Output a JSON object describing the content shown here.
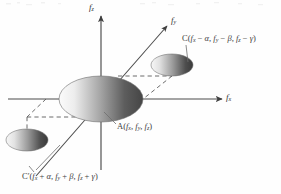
{
  "figure": {
    "kind": "3d-axes-diagram",
    "background_color": "#fefefe",
    "line_color": "#4a4a4a",
    "dash_color": "#5a5a5a",
    "text_color": "#3d3d3d"
  },
  "axes": [
    {
      "id": "fx",
      "label_main": "f",
      "label_sub": "x",
      "direction": "right-horizontal",
      "has_arrow": true
    },
    {
      "id": "fy",
      "label_main": "f",
      "label_sub": "y",
      "direction": "upper-right-diagonal",
      "has_arrow": true
    },
    {
      "id": "fz",
      "label_main": "f",
      "label_sub": "z",
      "direction": "up-vertical",
      "has_arrow": true
    }
  ],
  "points": {
    "A": {
      "name": "A",
      "prefix": "A(",
      "terms": [
        {
          "main": "f",
          "sub": "x"
        },
        {
          "main": "f",
          "sub": "y"
        },
        {
          "main": "f",
          "sub": "z"
        }
      ],
      "separators": [
        ", ",
        ", "
      ],
      "suffix": ")",
      "plain": "A(fx, fy, fz)"
    },
    "C": {
      "name": "C",
      "prefix": "C(",
      "terms": [
        {
          "main": "f",
          "sub": "x",
          "op": " − ",
          "greek": "α"
        },
        {
          "main": "f",
          "sub": "y",
          "op": " − ",
          "greek": "β"
        },
        {
          "main": "f",
          "sub": "z",
          "op": " − ",
          "greek": "γ"
        }
      ],
      "separators": [
        ", ",
        ", "
      ],
      "suffix": ")",
      "plain": "C(fx − α, fy − β, fz − γ)"
    },
    "C_prime": {
      "name": "C′",
      "prefix": "C′(",
      "terms": [
        {
          "main": "f",
          "sub": "x",
          "op": " + ",
          "greek": "α"
        },
        {
          "main": "f",
          "sub": "y",
          "op": " + ",
          "greek": "β"
        },
        {
          "main": "f",
          "sub": "z",
          "op": " + ",
          "greek": "γ"
        }
      ],
      "separators": [
        ", ",
        ", "
      ],
      "suffix": ")",
      "plain": "C′(fx + α, fy + β, fz + γ)"
    }
  },
  "disks": [
    {
      "id": "disk-A",
      "role": "origin-disk",
      "cx": 101,
      "cy": 99,
      "rx": 42,
      "ry": 23,
      "gradient_light": "#f2f2f2",
      "gradient_dark": "#4f4f4f"
    },
    {
      "id": "disk-C",
      "role": "upper-right-disk",
      "cx": 172,
      "cy": 65,
      "rx": 21,
      "ry": 11,
      "gradient_light": "#efefef",
      "gradient_dark": "#3f3f3f"
    },
    {
      "id": "disk-C-prime",
      "role": "lower-left-disk",
      "cx": 27,
      "cy": 140,
      "rx": 21,
      "ry": 11,
      "gradient_light": "#efefef",
      "gradient_dark": "#3f3f3f"
    }
  ],
  "connectors": {
    "dashed_projection": true,
    "leader_lines": true
  }
}
